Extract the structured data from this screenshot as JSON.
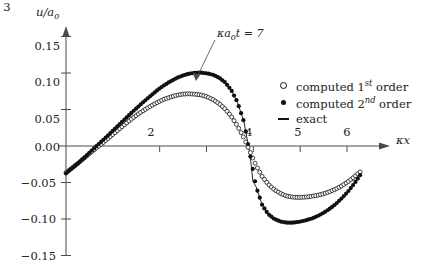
{
  "figure": {
    "ylabel": "u/a",
    "ylabel_sub": "o",
    "xlabel_k": "κ",
    "xlabel_x": "x",
    "annotation_pre": "κ",
    "annotation_a": "a",
    "annotation_sub": "o",
    "annotation_t": "t",
    "annotation_eq": "= 7",
    "annotation_full": "κ a_o t = 7"
  },
  "legend": {
    "position": "right-upper",
    "entries": [
      {
        "marker": "open-circle",
        "pre": "computed 1",
        "sup": "st",
        "post": " order"
      },
      {
        "marker": "filled-circle",
        "pre": "computed 2",
        "sup": "nd",
        "post": " order"
      },
      {
        "marker": "line",
        "pre": "exact",
        "sup": "",
        "post": ""
      }
    ]
  },
  "chart_data": {
    "type": "line",
    "title": "",
    "xlabel": "κx",
    "ylabel": "u/a_o",
    "annotation": "κ a_o t = 7",
    "xlim": [
      0,
      6.6
    ],
    "ylim": [
      -0.155,
      0.165
    ],
    "grid": false,
    "xticks": [
      2,
      3,
      4,
      5,
      6
    ],
    "xtick_labels": [
      "2",
      "3",
      "4",
      "5",
      "6"
    ],
    "yticks": [
      0.15,
      0.1,
      0.05,
      0.0,
      -0.05,
      -0.1,
      -0.15
    ],
    "ytick_labels": [
      "0.15",
      "0.10",
      "0.05",
      "0.00",
      "−0.05",
      "−0.10",
      "−0.15"
    ],
    "axis_arrows": [
      "x-right",
      "y-up"
    ],
    "series": [
      {
        "name": "computed 1st order",
        "marker": "open-circle",
        "color": "#111111",
        "x": [
          0.0,
          0.13,
          0.26,
          0.39,
          0.52,
          0.65,
          0.79,
          0.92,
          1.05,
          1.18,
          1.31,
          1.44,
          1.57,
          1.7,
          1.83,
          1.96,
          2.09,
          2.23,
          2.36,
          2.49,
          2.62,
          2.75,
          2.88,
          3.01,
          3.14,
          3.27,
          3.4,
          3.53,
          3.66,
          3.8,
          3.93,
          4.06,
          4.19,
          4.32,
          4.45,
          4.58,
          4.71,
          4.84,
          4.97,
          5.11,
          5.24,
          5.37,
          5.5,
          5.63,
          5.76,
          5.89,
          6.02,
          6.15,
          6.28
        ],
        "y": [
          -0.0365,
          -0.03,
          -0.0235,
          -0.0165,
          -0.0095,
          -0.0025,
          0.0045,
          0.0115,
          0.0185,
          0.0255,
          0.0325,
          0.039,
          0.045,
          0.0505,
          0.0555,
          0.06,
          0.064,
          0.067,
          0.0695,
          0.071,
          0.0715,
          0.071,
          0.07,
          0.0675,
          0.0635,
          0.058,
          0.0505,
          0.0405,
          0.0275,
          0.011,
          -0.008,
          -0.027,
          -0.042,
          -0.0525,
          -0.06,
          -0.065,
          -0.0685,
          -0.07,
          -0.0705,
          -0.07,
          -0.069,
          -0.0675,
          -0.0655,
          -0.0625,
          -0.059,
          -0.0545,
          -0.049,
          -0.0425,
          -0.0355
        ]
      },
      {
        "name": "computed 2nd order",
        "marker": "filled-circle",
        "color": "#111111",
        "x": [
          0.0,
          0.13,
          0.26,
          0.39,
          0.52,
          0.65,
          0.79,
          0.92,
          1.05,
          1.18,
          1.31,
          1.44,
          1.57,
          1.7,
          1.83,
          1.96,
          2.09,
          2.23,
          2.36,
          2.49,
          2.62,
          2.75,
          2.88,
          3.01,
          3.14,
          3.27,
          3.4,
          3.53,
          3.66,
          3.8,
          3.93,
          4.06,
          4.19,
          4.32,
          4.45,
          4.58,
          4.71,
          4.84,
          4.97,
          5.11,
          5.24,
          5.37,
          5.5,
          5.63,
          5.76,
          5.89,
          6.02,
          6.15,
          6.28
        ],
        "y": [
          -0.0375,
          -0.0305,
          -0.0235,
          -0.016,
          -0.008,
          0.0,
          0.008,
          0.016,
          0.024,
          0.032,
          0.04,
          0.048,
          0.0555,
          0.063,
          0.07,
          0.077,
          0.083,
          0.0885,
          0.093,
          0.0965,
          0.099,
          0.1002,
          0.1005,
          0.0995,
          0.0975,
          0.0935,
          0.087,
          0.0765,
          0.06,
          0.033,
          -0.012,
          -0.056,
          -0.081,
          -0.0935,
          -0.1,
          -0.1035,
          -0.105,
          -0.105,
          -0.104,
          -0.102,
          -0.0995,
          -0.096,
          -0.0915,
          -0.086,
          -0.0795,
          -0.0715,
          -0.0625,
          -0.052,
          -0.04
        ]
      },
      {
        "name": "exact",
        "marker": "line",
        "color": "#111111",
        "x": [
          0.0,
          0.13,
          0.26,
          0.39,
          0.52,
          0.65,
          0.79,
          0.92,
          1.05,
          1.18,
          1.31,
          1.44,
          1.57,
          1.7,
          1.83,
          1.96,
          2.09,
          2.23,
          2.36,
          2.49,
          2.62,
          2.75,
          2.88,
          3.01,
          3.14,
          3.27,
          3.4,
          3.53,
          3.66,
          3.8,
          3.93,
          3.99,
          4.06,
          4.19,
          4.32,
          4.45,
          4.58,
          4.71,
          4.84,
          4.97,
          5.11,
          5.24,
          5.37,
          5.5,
          5.63,
          5.76,
          5.89,
          6.02,
          6.15,
          6.28
        ],
        "y": [
          -0.0375,
          -0.0305,
          -0.0235,
          -0.016,
          -0.008,
          0.0,
          0.008,
          0.016,
          0.024,
          0.032,
          0.04,
          0.048,
          0.0555,
          0.063,
          0.07,
          0.077,
          0.083,
          0.0885,
          0.093,
          0.0965,
          0.099,
          0.1002,
          0.1005,
          0.0995,
          0.0975,
          0.0935,
          0.087,
          0.0765,
          0.06,
          0.033,
          -0.012,
          -0.048,
          -0.056,
          -0.081,
          -0.0935,
          -0.1,
          -0.1035,
          -0.105,
          -0.105,
          -0.104,
          -0.102,
          -0.0995,
          -0.096,
          -0.0915,
          -0.086,
          -0.0795,
          -0.0715,
          -0.0625,
          -0.052,
          -0.04
        ]
      }
    ]
  }
}
